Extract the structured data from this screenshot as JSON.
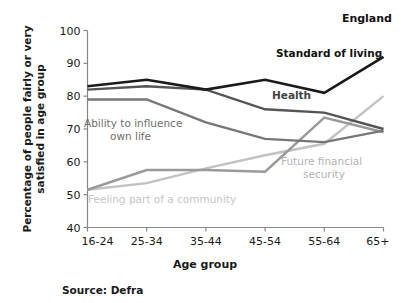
{
  "figure": {
    "region_label": "England",
    "source": "Source: Defra"
  },
  "chart_data": {
    "type": "line",
    "title": "",
    "subtitle": "",
    "xlabel": "Age group",
    "ylabel": "Percentage of people fairly or very satisfied in age group",
    "categories": [
      "16-24",
      "25-34",
      "35-44",
      "45-54",
      "55-64",
      "65+"
    ],
    "ylim": [
      40,
      100
    ],
    "yticks": [
      40,
      50,
      60,
      70,
      80,
      90,
      100
    ],
    "ytick_labels": [
      "40",
      "50",
      "60",
      "70",
      "80",
      "90",
      "100"
    ],
    "grid": false,
    "legend_position": "inline-annotations",
    "series": [
      {
        "name": "Standard of living",
        "color": "#1a1a1a",
        "width": 2.6,
        "values": [
          83,
          85,
          82,
          85,
          81,
          92
        ]
      },
      {
        "name": "Health",
        "color": "#555555",
        "width": 2.4,
        "values": [
          82,
          83,
          82,
          76,
          75,
          70
        ]
      },
      {
        "name": "Ability to influence own life",
        "color": "#777777",
        "width": 2.4,
        "values": [
          79,
          79,
          72,
          67,
          66,
          69.5
        ]
      },
      {
        "name": "Future financial security",
        "color": "#9a9a9a",
        "width": 2.4,
        "values": [
          51.5,
          57.5,
          57.5,
          57,
          73.5,
          69
        ]
      },
      {
        "name": "Feeling part of a community",
        "color": "#c2c2c2",
        "width": 2.4,
        "values": [
          51.5,
          53.5,
          58,
          62,
          65.5,
          80
        ]
      }
    ],
    "annotations": [
      {
        "text": "Standard of living",
        "color": "#111111",
        "bold": true,
        "x": 276,
        "y": 57
      },
      {
        "text": "Health",
        "color": "#444444",
        "bold": true,
        "x": 272,
        "y": 99
      },
      {
        "text": "Ability to influence",
        "color": "#6f6f6f",
        "bold": false,
        "x": 84,
        "y": 127
      },
      {
        "text": "own life",
        "color": "#6f6f6f",
        "bold": false,
        "x": 110,
        "y": 140
      },
      {
        "text": "Future financial",
        "color": "#b3b3b3",
        "bold": false,
        "x": 281,
        "y": 165
      },
      {
        "text": "security",
        "color": "#b3b3b3",
        "bold": false,
        "x": 303,
        "y": 178
      },
      {
        "text": "Feeling part of a community",
        "color": "#c6c6c6",
        "bold": false,
        "x": 88,
        "y": 203
      }
    ]
  }
}
